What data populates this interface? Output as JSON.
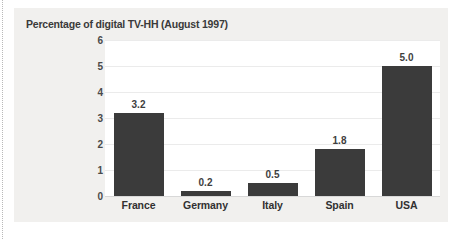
{
  "chart_data": {
    "type": "bar",
    "title": "Percentage of digital TV-HH (August 1997)",
    "xlabel": "",
    "ylabel": "",
    "categories": [
      "France",
      "Germany",
      "Italy",
      "Spain",
      "USA"
    ],
    "values": [
      3.2,
      0.2,
      0.5,
      1.8,
      5.0
    ],
    "value_labels": [
      "3.2",
      "0.2",
      "0.5",
      "1.8",
      "5.0"
    ],
    "ylim": [
      0,
      6
    ],
    "yticks": [
      0,
      1,
      2,
      3,
      4,
      5,
      6
    ],
    "ytick_labels": [
      "0",
      "1",
      "2",
      "3",
      "4",
      "5",
      "6"
    ],
    "grid": true,
    "legend": false,
    "legend_position": "none",
    "bar_color": "#3b3b3b",
    "plot_background": "#ffffff",
    "panel_background": "#f1f0ee",
    "text_color": "#3a3a3a"
  }
}
